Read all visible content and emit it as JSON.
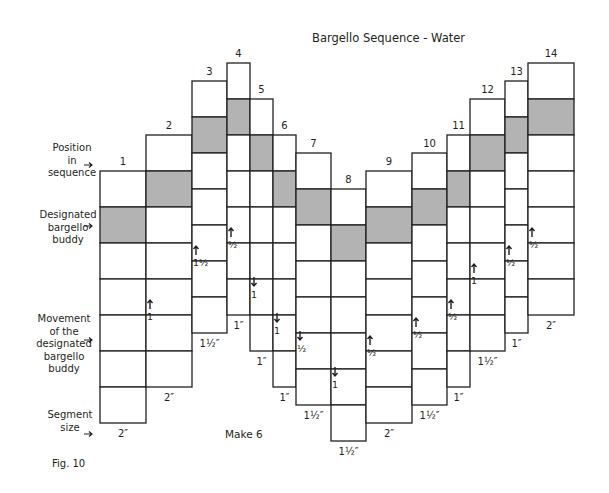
{
  "title": "Bargello Sequence - Water",
  "figure_caption": "Fig. 10",
  "make_note": "Make 6",
  "side_labels": {
    "position": [
      "Position",
      "in",
      "sequence"
    ],
    "buddy": [
      "Designated",
      "bargello",
      "buddy"
    ],
    "movement": [
      "Movement",
      "of the",
      "designated",
      "bargello",
      "buddy"
    ],
    "segment": [
      "Segment",
      "size"
    ]
  },
  "colors": {
    "shade": "#b3b3b3",
    "line": "#231f20"
  },
  "rows_per_strip": 7,
  "buddy_row": 2,
  "strips": [
    {
      "position": "1",
      "segment_size": "2″",
      "movement": null,
      "direction": null,
      "offset_units": 3
    },
    {
      "position": "2",
      "segment_size": "2″",
      "movement": "1",
      "direction": "up",
      "offset_units": 2
    },
    {
      "position": "3",
      "segment_size": "1½″",
      "movement": "1½",
      "direction": "up",
      "offset_units": 0.5
    },
    {
      "position": "4",
      "segment_size": "1″",
      "movement": "½",
      "direction": "up",
      "offset_units": 0
    },
    {
      "position": "5",
      "segment_size": "1″",
      "movement": "1",
      "direction": "down",
      "offset_units": 1
    },
    {
      "position": "6",
      "segment_size": "1″",
      "movement": "1",
      "direction": "down",
      "offset_units": 2
    },
    {
      "position": "7",
      "segment_size": "1½″",
      "movement": "½",
      "direction": "down",
      "offset_units": 2.5
    },
    {
      "position": "8",
      "segment_size": "1½″",
      "movement": "1",
      "direction": "down",
      "offset_units": 3.5
    },
    {
      "position": "9",
      "segment_size": "2″",
      "movement": "½",
      "direction": "up",
      "offset_units": 3
    },
    {
      "position": "10",
      "segment_size": "1½″",
      "movement": "½",
      "direction": "up",
      "offset_units": 2.5
    },
    {
      "position": "11",
      "segment_size": "1″",
      "movement": "½",
      "direction": "up",
      "offset_units": 2
    },
    {
      "position": "12",
      "segment_size": "1½″",
      "movement": "1",
      "direction": "up",
      "offset_units": 1
    },
    {
      "position": "13",
      "segment_size": "1″",
      "movement": "½",
      "direction": "up",
      "offset_units": 0.5
    },
    {
      "position": "14",
      "segment_size": "2″",
      "movement": "½",
      "direction": "up",
      "offset_units": 0
    }
  ]
}
